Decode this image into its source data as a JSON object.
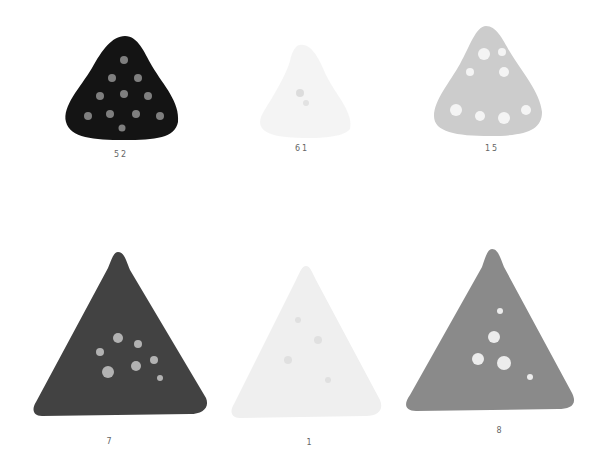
{
  "swatches": [
    {
      "label": "52",
      "color": "#141414",
      "hole": "#d8d8d8",
      "shape": "rounded-triangle"
    },
    {
      "label": "61",
      "color": "#eeeeee",
      "hole": "#ffffff",
      "shape": "rounded-triangle"
    },
    {
      "label": "15",
      "color": "#c8c8c8",
      "hole": "#f2f2f2",
      "shape": "rounded-triangle"
    },
    {
      "label": "7",
      "color": "#404040",
      "hole": "#cfcfcf",
      "shape": "triangle"
    },
    {
      "label": "1",
      "color": "#ececec",
      "hole": "#ffffff",
      "shape": "triangle"
    },
    {
      "label": "8",
      "color": "#8a8a8a",
      "hole": "#e6e6e6",
      "shape": "triangle"
    }
  ]
}
